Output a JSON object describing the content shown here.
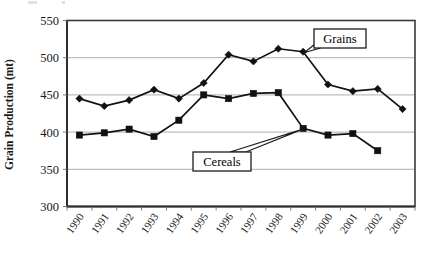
{
  "chart_data": {
    "type": "line",
    "title": "",
    "xlabel": "",
    "ylabel": "Grain Production (mt)",
    "categories": [
      "1990",
      "1991",
      "1992",
      "1993",
      "1994",
      "1995",
      "1996",
      "1997",
      "1998",
      "1999",
      "2000",
      "2001",
      "2002",
      "2003"
    ],
    "ylim": [
      300,
      550
    ],
    "ytick_values": [
      300,
      350,
      400,
      450,
      500,
      550
    ],
    "ytick_labels": [
      "300",
      "350",
      "400",
      "450",
      "500",
      "550"
    ],
    "grid": "horizontal",
    "legend_position": "inline-callouts",
    "series": [
      {
        "name": "Grains",
        "marker": "diamond",
        "color": "#111111",
        "values": [
          445,
          435,
          443,
          457,
          445,
          466,
          504,
          495,
          512,
          508,
          464,
          455,
          458,
          431
        ]
      },
      {
        "name": "Cereals",
        "marker": "square",
        "color": "#111111",
        "values": [
          396,
          399,
          404,
          394,
          416,
          450,
          445,
          452,
          453,
          405,
          396,
          398,
          375,
          null
        ]
      }
    ],
    "annotations": [
      {
        "label": "Grains",
        "points_to_series": "Grains",
        "points_to_category": "1999"
      },
      {
        "label": "Cereals",
        "points_to_series": "Cereals",
        "points_to_category": "1999"
      }
    ]
  },
  "axis": {
    "y_title": "Grain Production (mt)"
  }
}
